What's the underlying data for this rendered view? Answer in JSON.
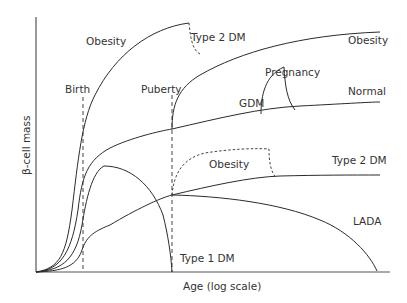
{
  "diagram": {
    "title": "",
    "axes": {
      "x_label": "Age (log scale)",
      "y_label": "β-cell mass"
    },
    "milestones": [
      {
        "label": "Birth"
      },
      {
        "label": "Puberty"
      }
    ],
    "curve_labels": {
      "obesity_upper_left": "Obesity",
      "type2dm_upper": "Type 2 DM",
      "obesity_upper_right": "Obesity",
      "pregnancy": "Pregnancy",
      "gdm": "GDM",
      "normal": "Normal",
      "obesity_middle": "Obesity",
      "type2dm_middle": "Type 2 DM",
      "lada": "LADA",
      "type1dm": "Type 1 DM"
    },
    "colors": {
      "line": "#2b2b2b",
      "text": "#333333",
      "background": "#ffffff"
    }
  }
}
